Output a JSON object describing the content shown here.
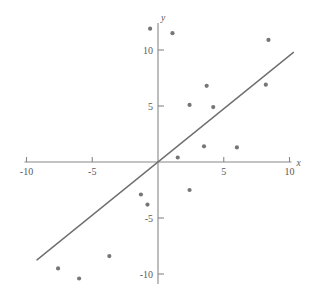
{
  "chart_data": {
    "type": "scatter",
    "title": "",
    "subtitle": "",
    "xlabel": "x",
    "ylabel": "y",
    "xlim": [
      -10,
      10
    ],
    "ylim": [
      -11,
      12.5
    ],
    "grid": false,
    "legend": null,
    "x_ticks": [
      -10,
      -5,
      5,
      10
    ],
    "y_ticks": [
      10,
      5,
      -5,
      -10
    ],
    "x_tick_labels": [
      "-10",
      "-5",
      "5",
      "10"
    ],
    "y_tick_labels": [
      "10",
      "5",
      "-5",
      "-10"
    ],
    "axis_origin": [
      0,
      0
    ],
    "point_color": "#767676",
    "line_color": "#6f6f6f",
    "axis_color": "#888888",
    "series": [
      {
        "name": "observations",
        "marker": "circle",
        "points": [
          {
            "x": -0.6,
            "y": 11.9
          },
          {
            "x": 1.1,
            "y": 11.5
          },
          {
            "x": 8.4,
            "y": 10.9
          },
          {
            "x": 3.7,
            "y": 6.8
          },
          {
            "x": 8.2,
            "y": 6.9
          },
          {
            "x": 2.4,
            "y": 5.1
          },
          {
            "x": 4.2,
            "y": 4.9
          },
          {
            "x": 3.5,
            "y": 1.4
          },
          {
            "x": 6.0,
            "y": 1.3
          },
          {
            "x": 1.5,
            "y": 0.4
          },
          {
            "x": 2.4,
            "y": -2.5
          },
          {
            "x": -1.3,
            "y": -2.9
          },
          {
            "x": -0.8,
            "y": -3.8
          },
          {
            "x": -3.7,
            "y": -8.4
          },
          {
            "x": -7.6,
            "y": -9.5
          },
          {
            "x": -6.0,
            "y": -10.4
          }
        ]
      }
    ],
    "fit_line": {
      "name": "trend-line",
      "slope": 0.95,
      "intercept": 0.0,
      "x_start": -9.2,
      "x_end": 10.3
    }
  }
}
